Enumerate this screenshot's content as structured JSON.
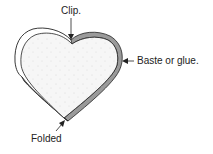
{
  "diagram": {
    "labels": {
      "clip": "Clip.",
      "baste": "Baste or glue.",
      "folded": "Folded"
    },
    "colors": {
      "outline": "#222222",
      "fold_fill": "#9a9a9a",
      "fabric_fill": "#f4f4f4",
      "background": "#ffffff"
    }
  }
}
